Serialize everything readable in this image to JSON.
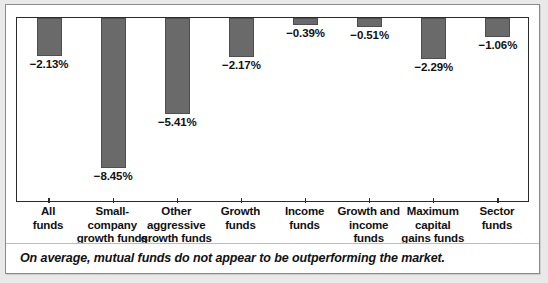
{
  "chart_data": {
    "type": "bar",
    "title": "",
    "subtitle": "",
    "xlabel": "",
    "ylabel": "",
    "orientation": "vertical-downward",
    "grid": false,
    "legend": null,
    "axis_baseline_at_top": true,
    "ylim": [
      -9.0,
      0
    ],
    "unit": "%",
    "categories": [
      "All\nfunds",
      "Small-company\ngrowth funds",
      "Other\naggressive\ngrowth funds",
      "Growth\nfunds",
      "Income\nfunds",
      "Growth and\nincome funds",
      "Maximum\ncapital\ngains funds",
      "Sector\nfunds"
    ],
    "category_lines": [
      [
        "All",
        "funds"
      ],
      [
        "Small-company",
        "growth funds"
      ],
      [
        "Other",
        "aggressive",
        "growth funds"
      ],
      [
        "Growth",
        "funds"
      ],
      [
        "Income",
        "funds"
      ],
      [
        "Growth and",
        "income funds"
      ],
      [
        "Maximum",
        "capital",
        "gains funds"
      ],
      [
        "Sector",
        "funds"
      ]
    ],
    "values": [
      -2.13,
      -8.45,
      -5.41,
      -2.17,
      -0.39,
      -0.51,
      -2.29,
      -1.06
    ],
    "data_labels": [
      "−2.13%",
      "−8.45%",
      "−5.41%",
      "−2.17%",
      "−0.39%",
      "−0.51%",
      "−2.29%",
      "−1.06%"
    ],
    "bar_color": "#6a6a6a",
    "bar_border_color": "#4e4e4e",
    "axis_color": "#2b2b2b"
  },
  "caption": {
    "text": "On average, mutual funds do not appear to be outperforming the market."
  }
}
